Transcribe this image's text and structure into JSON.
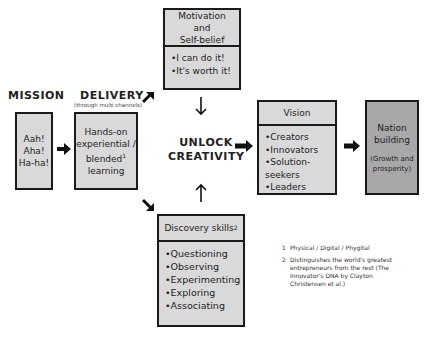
{
  "headings": {
    "mission": "MISSION",
    "delivery": "DELIVERY",
    "delivery_sub": "(through multi channels)",
    "center": [
      "UNLOCK",
      "CREATIVITY"
    ]
  },
  "mission_box": {
    "lines": [
      "Aah!",
      "Aha!",
      "Ha-ha!"
    ]
  },
  "delivery_box": {
    "lines": [
      "Hands-on",
      "experiential /",
      "blended",
      "learning"
    ],
    "footnote_ref": "1"
  },
  "motivation_box": {
    "title_lines": [
      "Motivation and",
      "Self-belief"
    ],
    "items": [
      "I can do it!",
      "It's worth it!"
    ]
  },
  "discovery_box": {
    "title": "Discovery skills",
    "footnote_ref": "2",
    "items": [
      "Questioning",
      "Observing",
      "Experimenting",
      "Exploring",
      "Associating"
    ]
  },
  "vision_box": {
    "title": "Vision",
    "items": [
      "Creators",
      "Innovators",
      "Solution-seekers",
      "Leaders"
    ]
  },
  "nation_box": {
    "lines": [
      "Nation",
      "building"
    ],
    "sub_lines": [
      "(Growth and",
      "prosperity)"
    ]
  },
  "footnotes": [
    {
      "num": "1",
      "text": "Physical / Digital / Phygital"
    },
    {
      "num": "2",
      "lines": [
        "Distinguishes the world's greatest",
        "entrepreneurs from the rest (The",
        "Innovator's DNA by Clayton",
        "Christensen et al.)"
      ]
    }
  ],
  "colors": {
    "box_fill": "#d9d9d9",
    "box_dark_fill": "#a8a8a8",
    "border": "#1a1a1a"
  }
}
